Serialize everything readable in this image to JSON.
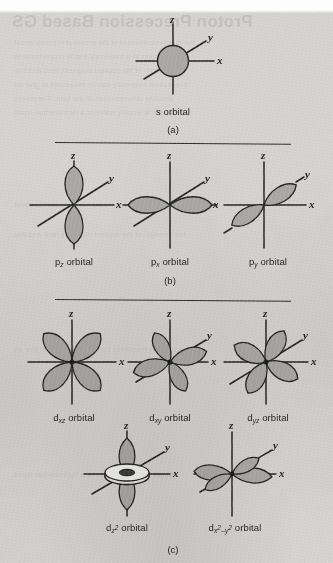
{
  "figure": {
    "background_color": "#d4d3d1",
    "ink_color": "#222222",
    "lobe_fill_color": "#a9a8a6",
    "axis_labels": {
      "x": "x",
      "y": "y",
      "z": "z"
    }
  },
  "bleed_through": {
    "title": "Proton Precession Based GS",
    "lines": [
      "the magnetic moment of the proton precesses about",
      "field direction at a frequency that is proportional to",
      "the strength of the applied magnetic field and this",
      "precession frequency can be measured to give an",
      "absolute determination of the field. The proton",
      "sample is usually water or a hydrocarbon liquid"
    ]
  },
  "sections": [
    {
      "id": "a",
      "label": "(a)",
      "orbitals": [
        {
          "id": "s",
          "type": "s",
          "caption": "s orbital",
          "caption_parts": {
            "base": "s",
            "sub": "",
            "sup": "",
            "suffix": " orbital"
          }
        }
      ]
    },
    {
      "id": "b",
      "label": "(b)",
      "orbitals": [
        {
          "id": "pz",
          "type": "p",
          "caption": "pz orbital",
          "caption_parts": {
            "base": "p",
            "sub": "z",
            "sup": "",
            "suffix": " orbital"
          }
        },
        {
          "id": "px",
          "type": "p",
          "caption": "px orbital",
          "caption_parts": {
            "base": "p",
            "sub": "x",
            "sup": "",
            "suffix": " orbital"
          }
        },
        {
          "id": "py",
          "type": "p",
          "caption": "py orbital",
          "caption_parts": {
            "base": "p",
            "sub": "y",
            "sup": "",
            "suffix": " orbital"
          }
        }
      ]
    },
    {
      "id": "c",
      "label": "(c)",
      "orbitals": [
        {
          "id": "dxz",
          "type": "d",
          "caption": "dxz orbital",
          "caption_parts": {
            "base": "d",
            "sub": "xz",
            "sup": "",
            "suffix": " orbital"
          }
        },
        {
          "id": "dxy",
          "type": "d",
          "caption": "dxy orbital",
          "caption_parts": {
            "base": "d",
            "sub": "xy",
            "sup": "",
            "suffix": " orbital"
          }
        },
        {
          "id": "dyz",
          "type": "d",
          "caption": "dyz orbital",
          "caption_parts": {
            "base": "d",
            "sub": "yz",
            "sup": "",
            "suffix": " orbital"
          }
        },
        {
          "id": "dz2",
          "type": "d",
          "caption": "dz2 orbital",
          "caption_parts": {
            "base": "d",
            "sub": "z",
            "sup": "2",
            "suffix": " orbital"
          }
        },
        {
          "id": "dx2y2",
          "type": "d",
          "caption": "dx2-y2 orbital",
          "caption_parts": {
            "base": "d",
            "sub": "x2-y2",
            "sup": "",
            "suffix": " orbital"
          }
        }
      ]
    }
  ],
  "captions": {
    "s_orbital": "s orbital",
    "pz_orbital": " orbital",
    "px_orbital": " orbital",
    "py_orbital": " orbital",
    "dxz_orbital": " orbital",
    "dxy_orbital": " orbital",
    "dyz_orbital": " orbital",
    "dz2_orbital": " orbital",
    "dx2y2_orbital": " orbital",
    "section_a": "(a)",
    "section_b": "(b)",
    "section_c": "(c)"
  },
  "symbols": {
    "p": "p",
    "d": "d",
    "s": "s",
    "x": "x",
    "y": "y",
    "z": "z",
    "xz": "xz",
    "xy": "xy",
    "yz": "yz",
    "two": "2",
    "minus": "–",
    "axis_x": "x",
    "axis_y": "y",
    "axis_z": "z"
  }
}
